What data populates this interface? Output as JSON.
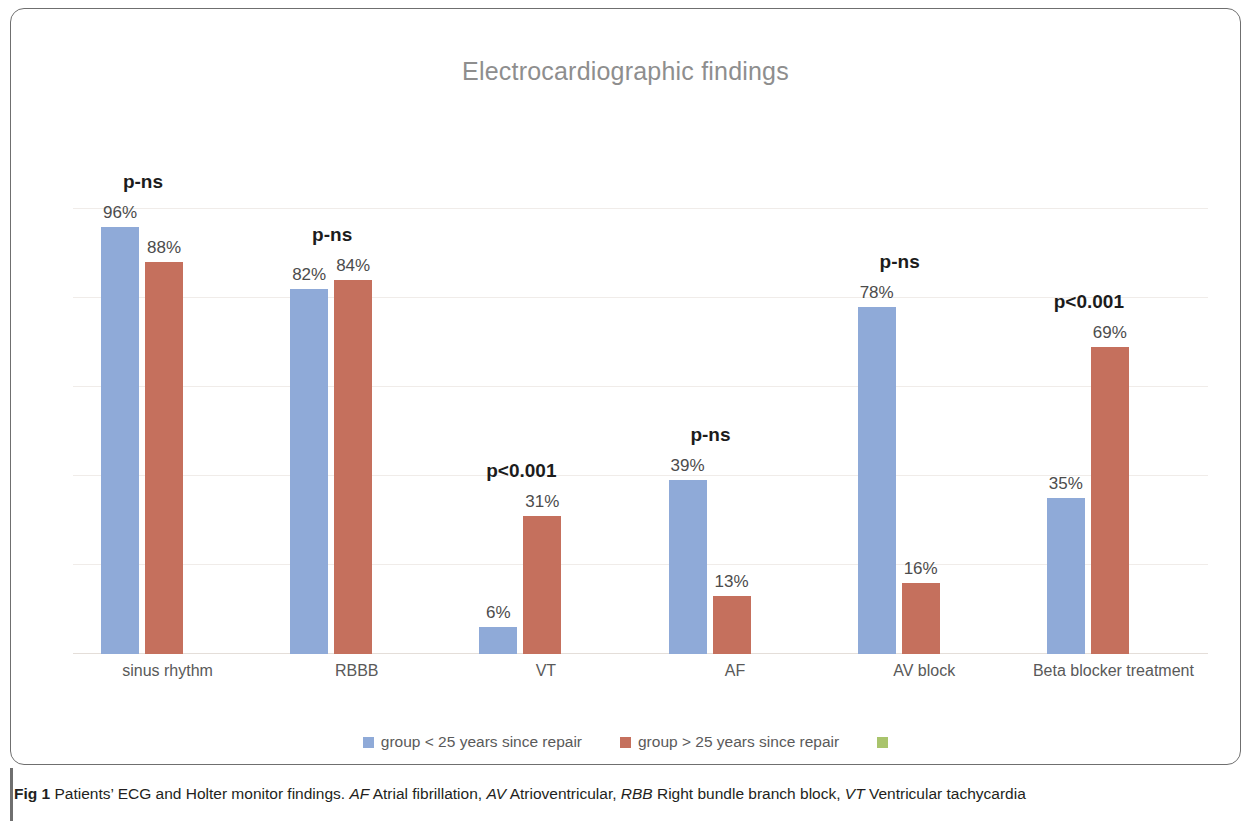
{
  "chart_data": {
    "type": "bar",
    "title": "Electrocardiographic findings",
    "xlabel": "",
    "ylabel": "",
    "ylim": [
      0,
      100
    ],
    "grid": true,
    "gridline_values": [
      100,
      80,
      60,
      40,
      20,
      0
    ],
    "legend_position": "bottom",
    "categories": [
      "sinus rhythm",
      "RBBB",
      "VT",
      "AF",
      "AV block",
      "Beta blocker treatment"
    ],
    "series": [
      {
        "name": "group < 25 years since repair",
        "color": "#8faad8",
        "values": [
          96,
          82,
          6,
          39,
          78,
          35
        ],
        "value_labels": [
          "96%",
          "82%",
          "6%",
          "39%",
          "78%",
          "35%"
        ]
      },
      {
        "name": "group > 25 years since repair",
        "color": "#c5705d",
        "values": [
          88,
          84,
          31,
          13,
          16,
          69
        ],
        "value_labels": [
          "88%",
          "84%",
          "31%",
          "13%",
          "16%",
          "69%"
        ]
      }
    ],
    "annotations": {
      "p_values": [
        "p-ns",
        "p-ns",
        "p<0.001",
        "p-ns",
        "p-ns",
        "p<0.001"
      ]
    },
    "extra_legend_swatch_color": "#a9c46c"
  },
  "caption": {
    "figure_number": "Fig 1",
    "text": " Patients’ ECG and Holter monitor findings. ",
    "abbreviations": [
      {
        "abbr": "AF",
        "definition": " Atrial fibrillation, "
      },
      {
        "abbr": "AV",
        "definition": " Atrioventricular, "
      },
      {
        "abbr": "RBB",
        "definition": " Right bundle branch block, "
      },
      {
        "abbr": "VT",
        "definition": " Ventricular tachycardia"
      }
    ]
  }
}
